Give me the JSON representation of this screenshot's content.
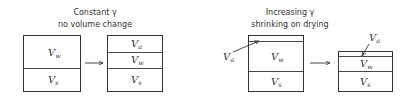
{
  "left_panel": {
    "title_line1": "Constant γ",
    "title_line2": "no volume change",
    "before_box": {
      "layers": [
        {
          "label": "V",
          "sub": "w"
        },
        {
          "label": "V",
          "sub": "s"
        }
      ]
    },
    "after_box": {
      "layers": [
        {
          "label": "V",
          "sub": "a"
        },
        {
          "label": "V",
          "sub": "w"
        },
        {
          "label": "V",
          "sub": "s"
        }
      ]
    },
    "arrow": "right-arrow"
  },
  "right_panel": {
    "title_line1": "Increasing γ",
    "title_line2": "shrinking on drying",
    "before_box": {
      "callout": {
        "label": "V",
        "sub": "a"
      },
      "layers": [
        {
          "label": "V",
          "sub": "w"
        },
        {
          "label": "V",
          "sub": "s"
        }
      ]
    },
    "after_box": {
      "callout": {
        "label": "V",
        "sub": "a"
      },
      "layers": [
        {
          "label": "V",
          "sub": "w"
        },
        {
          "label": "V",
          "sub": "s"
        }
      ]
    },
    "arrow": "right-arrow"
  }
}
